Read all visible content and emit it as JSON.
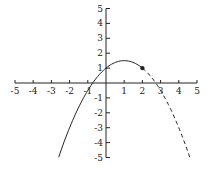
{
  "chart_data": {
    "type": "line",
    "title": "",
    "xlabel": "",
    "ylabel": "",
    "xlim": [
      -5,
      5
    ],
    "ylim": [
      -5,
      5
    ],
    "grid": false,
    "x_ticks": [
      -5,
      -4,
      -3,
      -2,
      -1,
      1,
      2,
      3,
      4,
      5
    ],
    "y_ticks": [
      5,
      4,
      3,
      2,
      1,
      -1,
      -2,
      -3,
      -4,
      -5
    ],
    "function": "y = -0.5x^2 + x + 1",
    "vertex": [
      1,
      1.5
    ],
    "marked_point": [
      2,
      1
    ],
    "series": [
      {
        "name": "solid segment",
        "style": "solid",
        "x_range": [
          -2.6,
          2
        ],
        "x": [
          -2.6,
          -2,
          -1,
          0,
          1,
          2
        ],
        "y": [
          -5,
          -3,
          -0.5,
          1,
          1.5,
          1
        ]
      },
      {
        "name": "dashed segment",
        "style": "dashed",
        "x_range": [
          2,
          4.6
        ],
        "x": [
          2,
          3,
          4,
          4.6
        ],
        "y": [
          1,
          -0.5,
          -3,
          -5
        ]
      }
    ]
  },
  "style": {
    "line_color": "#222222",
    "axis_color": "#222222",
    "background": "#ffffff"
  },
  "layout": {
    "origin_px": [
      106,
      83
    ],
    "x_unit_px": 18.2,
    "y_unit_px": 14.9
  }
}
